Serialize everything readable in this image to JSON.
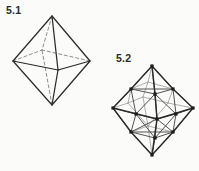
{
  "page": {
    "background_color": "#fbfbfa",
    "ink_color": "#2b2b2b",
    "width": 199,
    "height": 171
  },
  "figures": [
    {
      "id": "figure-5-1",
      "label": "5.1",
      "caption": "5.1",
      "shape_name": "octahedron",
      "description": "Regular octahedron drawn in wireframe with hidden rear edges shown as dashed lines.",
      "line_color": "#2b2b2b",
      "hidden_line_color": "#8b8b8b",
      "hidden_line_style": "dashed",
      "vertex_markers": false,
      "vertex_count": 6,
      "edge_count": 12,
      "face_count": 8,
      "vertices": {
        "top": [
          52,
          16
        ],
        "bottom": [
          52,
          105
        ],
        "left": [
          13,
          61
        ],
        "right": [
          90,
          61
        ],
        "front": [
          58,
          70
        ],
        "back": [
          42,
          50
        ]
      },
      "solid_edges": [
        [
          "top",
          "left"
        ],
        [
          "top",
          "right"
        ],
        [
          "top",
          "front"
        ],
        [
          "bottom",
          "left"
        ],
        [
          "bottom",
          "right"
        ],
        [
          "bottom",
          "front"
        ],
        [
          "left",
          "front"
        ],
        [
          "right",
          "front"
        ]
      ],
      "hidden_edges": [
        [
          "top",
          "back"
        ],
        [
          "bottom",
          "back"
        ],
        [
          "left",
          "back"
        ],
        [
          "right",
          "back"
        ]
      ]
    },
    {
      "id": "figure-5-2",
      "label": "5.2",
      "caption": "5.2",
      "shape_name": "subdivided-octahedron",
      "description": "Octahedron with each triangular face subdivided, edge midpoints marked with solid dots.",
      "line_color": "#2b2b2b",
      "inner_line_color": "#4a4a4a",
      "hidden_line_color": "#9a9a9a",
      "vertex_markers": true,
      "vertex_marker_shape": "square-dot",
      "vertex_marker_size": 2.6,
      "vertex_count": 18,
      "vertices": {
        "top": [
          152,
          66
        ],
        "bottom": [
          152,
          155
        ],
        "left": [
          113,
          108
        ],
        "right": [
          193,
          108
        ],
        "front": [
          157,
          119
        ],
        "back": [
          143,
          97
        ],
        "m_top_left": [
          131,
          89
        ],
        "m_top_right": [
          173,
          89
        ],
        "m_top_front": [
          155,
          94
        ],
        "m_top_back": [
          148,
          82
        ],
        "m_bot_left": [
          131,
          132
        ],
        "m_bot_right": [
          173,
          132
        ],
        "m_bot_front": [
          155,
          138
        ],
        "m_bot_back": [
          148,
          126
        ],
        "m_left_front": [
          136,
          114
        ],
        "m_right_front": [
          176,
          114
        ],
        "m_left_back": [
          128,
          103
        ],
        "m_right_back": [
          168,
          103
        ]
      }
    }
  ]
}
